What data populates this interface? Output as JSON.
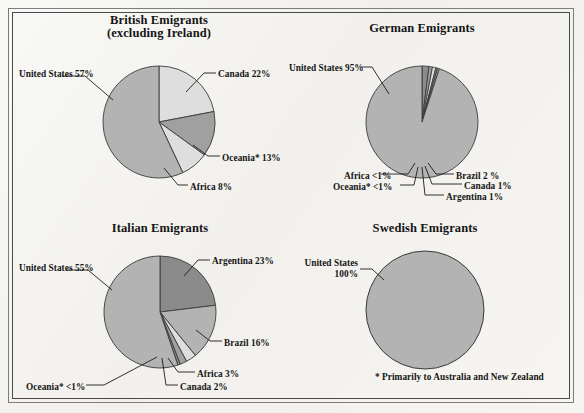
{
  "figure": {
    "background_color": "#f2f1ed",
    "frame_outer_color": "#7d7d7d",
    "frame_inner_color": "#4a4a4a",
    "footnote": "* Primarily to Australia and New Zealand"
  },
  "palette": {
    "slice_light": "#dedede",
    "slice_mid": "#b3b3b3",
    "slice_mid_dark": "#a0a0a0",
    "slice_dark": "#8b8b8b",
    "slice_edge": "#3a3a3a",
    "text": "#151515"
  },
  "charts": [
    {
      "id": "british",
      "title": "British Emigrants\n(excluding Ireland)",
      "center_x": 159,
      "center_y": 122,
      "radius": 56,
      "slices": [
        {
          "label": "Canada 22%",
          "value": 22,
          "fill": "#dedede",
          "label_x": 218,
          "label_y": 69,
          "align": "left"
        },
        {
          "label": "Oceania* 13%",
          "value": 13,
          "fill": "#a0a0a0",
          "label_x": 222,
          "label_y": 153,
          "align": "left"
        },
        {
          "label": "Africa 8%",
          "value": 8,
          "fill": "#dedede",
          "label_x": 190,
          "label_y": 182,
          "align": "left"
        },
        {
          "label": "United States 57%",
          "value": 57,
          "fill": "#b3b3b3",
          "label_x": 19,
          "label_y": 69,
          "align": "left"
        }
      ]
    },
    {
      "id": "german",
      "title": "German Emigrants",
      "center_x": 422,
      "center_y": 122,
      "radius": 56,
      "slices": [
        {
          "label": "United States 95%",
          "value": 95,
          "fill": "#b3b3b3",
          "label_x": 289,
          "label_y": 63,
          "align": "left"
        },
        {
          "label": "Brazil 2 %",
          "value": 2,
          "fill": "#8b8b8b",
          "label_x": 456,
          "label_y": 171,
          "align": "left"
        },
        {
          "label": "Canada 1%",
          "value": 1,
          "fill": "#a0a0a0",
          "label_x": 464,
          "label_y": 181,
          "align": "left"
        },
        {
          "label": "Argentina 1%",
          "value": 1,
          "fill": "#dedede",
          "label_x": 446,
          "label_y": 192,
          "align": "left"
        },
        {
          "label": "Oceania* <1%",
          "value": 0.5,
          "fill": "#8b8b8b",
          "label_x": 333,
          "label_y": 182,
          "align": "left"
        },
        {
          "label": "Africa <1%",
          "value": 0.5,
          "fill": "#b3b3b3",
          "label_x": 344,
          "label_y": 171,
          "align": "left"
        }
      ]
    },
    {
      "id": "italian",
      "title": "Italian Emigrants",
      "center_x": 160,
      "center_y": 312,
      "radius": 56,
      "slices": [
        {
          "label": "Argentina 23%",
          "value": 23,
          "fill": "#8b8b8b",
          "label_x": 212,
          "label_y": 256,
          "align": "left"
        },
        {
          "label": "Brazil 16%",
          "value": 16,
          "fill": "#b3b3b3",
          "label_x": 224,
          "label_y": 338,
          "align": "left"
        },
        {
          "label": "Africa 3%",
          "value": 3,
          "fill": "#dedede",
          "label_x": 197,
          "label_y": 369,
          "align": "left"
        },
        {
          "label": "Canada 2%",
          "value": 2,
          "fill": "#a0a0a0",
          "label_x": 180,
          "label_y": 382,
          "align": "left"
        },
        {
          "label": "Oceania* <1%",
          "value": 0.7,
          "fill": "#8b8b8b",
          "label_x": 26,
          "label_y": 382,
          "align": "left"
        },
        {
          "label": "United States 55%",
          "value": 55,
          "fill": "#b3b3b3",
          "label_x": 19,
          "label_y": 263,
          "align": "left"
        }
      ]
    },
    {
      "id": "swedish",
      "title": "Swedish Emigrants",
      "center_x": 425,
      "center_y": 310,
      "radius": 59,
      "slices": [
        {
          "label": "United States\n100%",
          "value": 100,
          "fill": "#b3b3b3",
          "label_x": 300,
          "label_y": 258,
          "align": "left"
        }
      ]
    }
  ],
  "chart_data": {
    "type": "pie",
    "note": "* Primarily to Australia and New Zealand",
    "panels": [
      {
        "name": "British Emigrants (excluding Ireland)",
        "categories": [
          "United States",
          "Canada",
          "Oceania*",
          "Africa"
        ],
        "values": [
          57,
          22,
          13,
          8
        ],
        "labels": [
          "United States 57%",
          "Canada 22%",
          "Oceania* 13%",
          "Africa 8%"
        ],
        "unit": "percent"
      },
      {
        "name": "German Emigrants",
        "categories": [
          "United States",
          "Brazil",
          "Canada",
          "Argentina",
          "Oceania*",
          "Africa"
        ],
        "values": [
          95,
          2,
          1,
          1,
          0.5,
          0.5
        ],
        "labels": [
          "United States 95%",
          "Brazil 2 %",
          "Canada 1%",
          "Argentina 1%",
          "Oceania* <1%",
          "Africa <1%"
        ],
        "unit": "percent"
      },
      {
        "name": "Italian Emigrants",
        "categories": [
          "United States",
          "Argentina",
          "Brazil",
          "Africa",
          "Canada",
          "Oceania*"
        ],
        "values": [
          55,
          23,
          16,
          3,
          2,
          0.7
        ],
        "labels": [
          "United States 55%",
          "Argentina 23%",
          "Brazil 16%",
          "Africa 3%",
          "Canada 2%",
          "Oceania* <1%"
        ],
        "unit": "percent"
      },
      {
        "name": "Swedish Emigrants",
        "categories": [
          "United States"
        ],
        "values": [
          100
        ],
        "labels": [
          "United States 100%"
        ],
        "unit": "percent"
      }
    ],
    "legend": "none",
    "grid": false
  }
}
